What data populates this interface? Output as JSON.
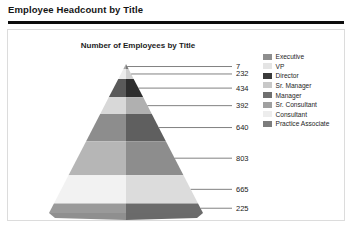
{
  "report": {
    "title": "Employee Headcount by Title"
  },
  "chart_panel": {
    "title": "Number of Employees by Title"
  },
  "chart_data": {
    "type": "pie",
    "chart_subtype": "pyramid-3d",
    "title": "Number of Employees by Title",
    "xlabel": "",
    "ylabel": "",
    "legend_position": "right",
    "grid": false,
    "categories": [
      "Executive",
      "VP",
      "Director",
      "Sr. Manager",
      "Manager",
      "Sr. Consultant",
      "Consultant",
      "Practice Associate"
    ],
    "values": [
      7,
      232,
      434,
      392,
      640,
      803,
      665,
      225
    ],
    "data_labels": [
      "7",
      "232",
      "434",
      "392",
      "640",
      "803",
      "665",
      "225"
    ],
    "colors": [
      "#8e8e8e",
      "#e4e4e4",
      "#3a3a3a",
      "#c8c8c8",
      "#6f6f6f",
      "#a0a0a0",
      "#ededed",
      "#7c7c7c"
    ],
    "face_colors_left": [
      "#a8a8a8",
      "#ececec",
      "#5a5a5a",
      "#d8d8d8",
      "#8d8d8d",
      "#b6b6b6",
      "#f2f2f2",
      "#9a9a9a"
    ],
    "face_colors_right": [
      "#7a7a7a",
      "#cfcfcf",
      "#2e2e2e",
      "#b0b0b0",
      "#5f5f5f",
      "#8d8d8d",
      "#dcdcdc",
      "#6b6b6b"
    ]
  },
  "legend": {
    "items": [
      {
        "label": "Executive"
      },
      {
        "label": "VP"
      },
      {
        "label": "Director"
      },
      {
        "label": "Sr. Manager"
      },
      {
        "label": "Manager"
      },
      {
        "label": "Sr. Consultant"
      },
      {
        "label": "Consultant"
      },
      {
        "label": "Practice Associate"
      }
    ]
  }
}
